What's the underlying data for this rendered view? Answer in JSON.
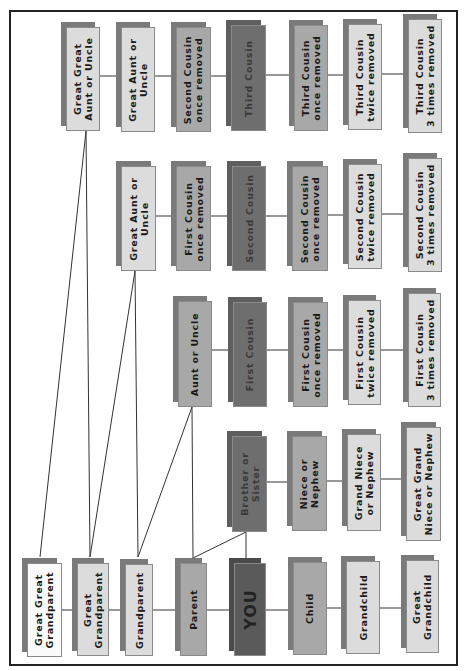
{
  "diagram": {
    "title": "",
    "type": "family-relationship-chart",
    "orientation": "rotated-90",
    "colors": {
      "white": "#fbfbfb",
      "light": "#dcdcdc",
      "midlight": "#c4c4c4",
      "mid": "#a8a8a8",
      "dark": "#6e6e6e",
      "you": "#5a5a5a",
      "shadow": "#7a7a7a",
      "line": "#333333",
      "frame": "#222222"
    },
    "nodes": {
      "great_great_grandparent": "Great Great\nGrandparent",
      "great_grandparent": "Great\nGrandparent",
      "grandparent": "Grandparent",
      "parent": "Parent",
      "you": "YOU",
      "child": "Child",
      "grandchild": "Grandchild",
      "great_grandchild": "Great\nGrandchild",
      "brother_or_sister": "Brother or\nSister",
      "niece_or_nephew": "Niece or\nNephew",
      "grand_niece_or_nephew": "Grand Niece\nor Nephew",
      "great_grand_niece_or_nephew": "Great Grand\nNiece or Nephew",
      "aunt_or_uncle": "Aunt or Uncle",
      "first_cousin": "First Cousin",
      "first_cousin_once_removed": "First Cousin\nonce removed",
      "first_cousin_twice_removed": "First Cousin\ntwice removed",
      "first_cousin_3_times_removed": "First Cousin\n3 times removed",
      "great_aunt_or_uncle": "Great Aunt or\nUncle",
      "first_cousin_once_removed_2": "First Cousin\nonce removed",
      "second_cousin": "Second Cousin",
      "second_cousin_once_removed": "Second Cousin\nonce removed",
      "second_cousin_twice_removed": "Second Cousin\ntwice removed",
      "second_cousin_3_times_removed": "Second Cousin\n3 times removed",
      "great_great_aunt_or_uncle": "Great Great\nAunt or Uncle",
      "great_aunt_or_uncle_2": "Great Aunt or\nUncle",
      "second_cousin_once_removed_2": "Second Cousin\nonce removed",
      "third_cousin": "Third Cousin",
      "third_cousin_once_removed": "Third Cousin\nonce removed",
      "third_cousin_twice_removed": "Third Cousin\ntwice removed",
      "third_cousin_3_times_removed": "Third Cousin\n3 times removed"
    }
  }
}
